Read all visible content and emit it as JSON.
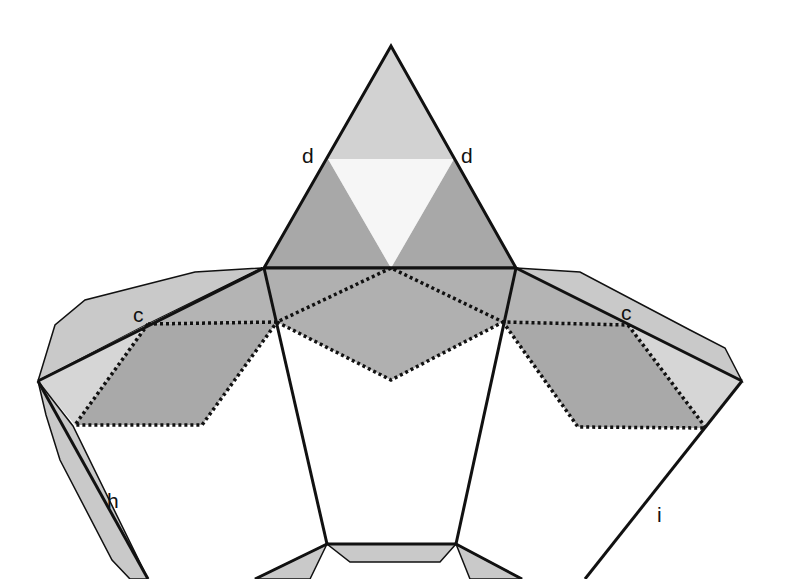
{
  "diagram": {
    "type": "polyhedron-net",
    "labels": {
      "d_left": "d",
      "d_right": "d",
      "c_left": "c",
      "c_right": "c",
      "h": "h",
      "i": "i"
    },
    "colors": {
      "background": "#ffffff",
      "outline": "#111111",
      "light_gray": "#d4d4d4",
      "mid_gray": "#bdbdbd",
      "dark_gray": "#a6a6a6",
      "white_tri": "#f6f6f6",
      "flap_gray": "#c9c9c9"
    }
  }
}
